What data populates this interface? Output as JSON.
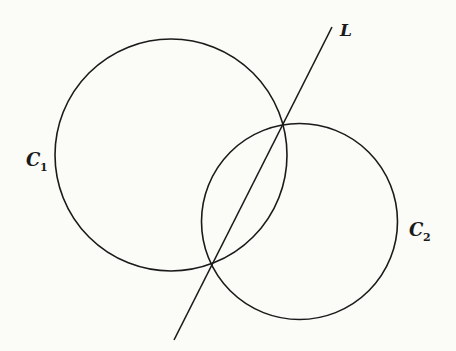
{
  "diagram": {
    "type": "geometry",
    "stroke_color": "#1a1a1a",
    "background": "#fbfbf8",
    "circles": [
      {
        "id": "C1",
        "label": "C",
        "subscript": "1",
        "cx": 171,
        "cy": 155,
        "r": 116
      },
      {
        "id": "C2",
        "label": "C",
        "subscript": "2",
        "cx": 299.5,
        "cy": 221.5,
        "r": 98
      }
    ],
    "line": {
      "id": "L",
      "label": "L",
      "x1": 332,
      "y1": 27,
      "x2": 174,
      "y2": 340
    },
    "intersections": [
      {
        "x": 283,
        "y": 123
      },
      {
        "x": 212,
        "y": 263
      }
    ]
  },
  "labels": {
    "L": "L",
    "C1_main": "C",
    "C1_sub": "1",
    "C2_main": "C",
    "C2_sub": "2"
  }
}
